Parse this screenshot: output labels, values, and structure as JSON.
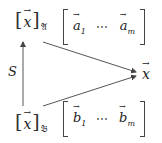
{
  "diagram": {
    "top_coord": {
      "vector": "x",
      "basis": "𝔄"
    },
    "bottom_coord": {
      "vector": "x",
      "basis": "𝔅"
    },
    "top_matrix": {
      "first": "a",
      "first_sub": "1",
      "dots": "⋯",
      "last": "a",
      "last_sub": "m"
    },
    "bottom_matrix": {
      "first": "b",
      "first_sub": "1",
      "dots": "⋯",
      "last": "b",
      "last_sub": "m"
    },
    "target": "x",
    "arrow_label": "S",
    "colors": {
      "stroke": "#444444",
      "text": "#222222",
      "background": "#ffffff"
    }
  }
}
